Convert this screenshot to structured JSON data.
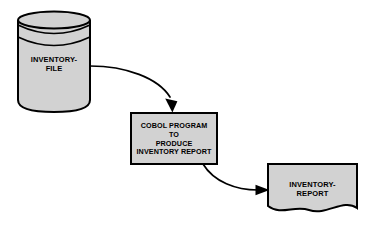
{
  "diagram": {
    "type": "system-flowchart",
    "background_color": "#ffffff",
    "shape_fill_color": "#d2d2d2",
    "shape_stroke_color": "#000000",
    "nodes": [
      {
        "id": "inventory-file",
        "shape": "magnetic-disk-cylinder",
        "label": "INVENTORY-\nFILE",
        "label_lines": [
          "INVENTORY-",
          "FILE"
        ]
      },
      {
        "id": "cobol-program",
        "shape": "process-rectangle",
        "label": "COBOL PROGRAM\nTO\nPRODUCE\nINVENTORY REPORT",
        "label_lines": [
          "COBOL PROGRAM",
          "TO",
          "PRODUCE",
          "INVENTORY REPORT"
        ]
      },
      {
        "id": "inventory-report",
        "shape": "document",
        "label": "INVENTORY-\nREPORT",
        "label_lines": [
          "INVENTORY-",
          "REPORT"
        ]
      }
    ],
    "connectors": [
      {
        "id": "file-to-program",
        "from": "inventory-file",
        "to": "cobol-program",
        "style": "curved-arrow",
        "direction": "down-right"
      },
      {
        "id": "program-to-report",
        "from": "cobol-program",
        "to": "inventory-report",
        "style": "curved-arrow",
        "direction": "down-right"
      }
    ]
  }
}
